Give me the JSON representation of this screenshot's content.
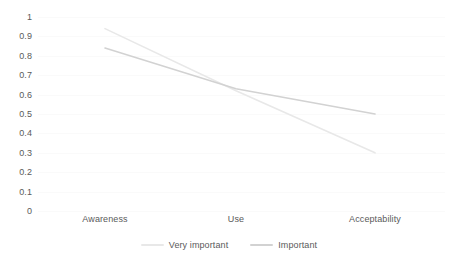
{
  "chart_data": {
    "type": "line",
    "title": "",
    "subtitle": "",
    "xlabel": "",
    "ylabel": "",
    "categories": [
      "Awareness",
      "Use",
      "Acceptability"
    ],
    "series": [
      {
        "name": "Very important",
        "values": [
          0.94,
          0.62,
          0.3
        ],
        "color": "#e8e8e8"
      },
      {
        "name": "Important",
        "values": [
          0.84,
          0.63,
          0.5
        ],
        "color": "#d2d2d2"
      }
    ],
    "ylim": [
      0,
      1
    ],
    "ytick_labels": [
      "1",
      "0.9",
      "0.8",
      "0.7",
      "0.6",
      "0.5",
      "0.4",
      "0.3",
      "0.2",
      "0.1",
      "0"
    ],
    "ytick_values": [
      1,
      0.9,
      0.8,
      0.7,
      0.6,
      0.5,
      0.4,
      0.3,
      0.2,
      0.1,
      0
    ],
    "grid": true,
    "grid_color": "#fafafa",
    "legend_position": "bottom",
    "background_color": "#ffffff",
    "text_color": "#5a5a5a"
  },
  "axes": {
    "y_ticks": [
      {
        "label": "1",
        "value": 1
      },
      {
        "label": "0.9",
        "value": 0.9
      },
      {
        "label": "0.8",
        "value": 0.8
      },
      {
        "label": "0.7",
        "value": 0.7
      },
      {
        "label": "0.6",
        "value": 0.6
      },
      {
        "label": "0.5",
        "value": 0.5
      },
      {
        "label": "0.4",
        "value": 0.4
      },
      {
        "label": "0.3",
        "value": 0.3
      },
      {
        "label": "0.2",
        "value": 0.2
      },
      {
        "label": "0.1",
        "value": 0.1
      },
      {
        "label": "0",
        "value": 0
      }
    ],
    "x_ticks": [
      {
        "label": "Awareness"
      },
      {
        "label": "Use"
      },
      {
        "label": "Acceptability"
      }
    ]
  },
  "legend": {
    "items": [
      {
        "label": "Very important",
        "color": "#e8e8e8"
      },
      {
        "label": "Important",
        "color": "#d2d2d2"
      }
    ]
  }
}
